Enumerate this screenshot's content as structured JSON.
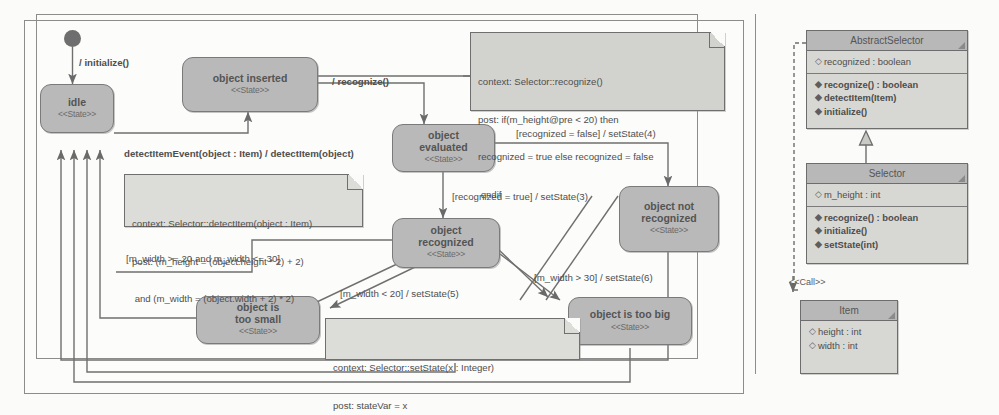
{
  "diagram": {
    "kind": "uml-state-machine-and-class-diagram",
    "title": "",
    "colors": {
      "state_fill": "#b9b9b9",
      "state_border": "#7a7a7a",
      "note_fill": "#d2d2ce",
      "class_fill": "#d7d7d3",
      "class_header_fill": "#b8b8b8",
      "line": "#6f6f6f",
      "page_bg": "#fbfbf9"
    }
  },
  "statechart": {
    "initial_pseudostate": "initial-state",
    "states": [
      {
        "id": "idle",
        "name": "idle",
        "stereotype": "<<State>>"
      },
      {
        "id": "object_inserted",
        "name": "object inserted",
        "stereotype": "<<State>>"
      },
      {
        "id": "object_evaluated",
        "name": "object\nevaluated",
        "name_l1": "object",
        "name_l2": "evaluated",
        "stereotype": "<<State>>"
      },
      {
        "id": "object_recognized",
        "name": "object\nrecognized",
        "name_l1": "object",
        "name_l2": "recognized",
        "stereotype": "<<State>>"
      },
      {
        "id": "object_not_recognized",
        "name_l1": "object not",
        "name_l2": "recognized",
        "stereotype": "<<State>>"
      },
      {
        "id": "object_is_too_small",
        "name_l1": "object is",
        "name_l2": "too small",
        "stereotype": "<<State>>"
      },
      {
        "id": "object_is_too_big",
        "name_l1": "object is too big",
        "name_l2": "",
        "stereotype": "<<State>>"
      }
    ],
    "transition_labels": [
      {
        "id": "t_initialize",
        "text": "/ initialize()"
      },
      {
        "id": "t_detect",
        "text": "detectItemEvent(object : Item) / detectItem(object)"
      },
      {
        "id": "t_recognize",
        "text": "/ recognize()"
      },
      {
        "id": "t_rec_false",
        "text": "[recognized = false] / setState(4)"
      },
      {
        "id": "t_rec_true",
        "text": "[recognized = true] / setState(3)"
      },
      {
        "id": "t_width_range",
        "text": "[m_width >= 20 and m_width <= 30]"
      },
      {
        "id": "t_width_lt20",
        "text": "[m_width < 20] / setState(5)"
      },
      {
        "id": "t_width_gt30",
        "text": "[m_width > 30] / setState(6)"
      }
    ],
    "notes": [
      {
        "id": "note_recognize",
        "lines": [
          "context: Selector::recognize()",
          "post: if(m_height@pre < 20) then",
          "recognized = true else recognized = false",
          " endif"
        ]
      },
      {
        "id": "note_detectitem",
        "lines": [
          "context: Selector::detectItem(object : Item)",
          "post: (m_height = (object.height * 2) + 2)",
          " and (m_width = (object.width + 2) * 2)"
        ]
      },
      {
        "id": "note_setstate",
        "lines": [
          "context: Selector::setState(x : Integer)",
          "post: stateVar = x"
        ]
      }
    ]
  },
  "class_diagram": {
    "classes": [
      {
        "id": "abstract_selector",
        "name": "AbstractSelector",
        "attributes": [
          {
            "glyph": "attr-icon",
            "text": "recognized : boolean"
          }
        ],
        "operations": [
          {
            "glyph": "op-icon",
            "text": "recognize() : boolean"
          },
          {
            "glyph": "op-icon",
            "text": "detectItem(Item)"
          },
          {
            "glyph": "op-icon",
            "text": "initialize()"
          }
        ]
      },
      {
        "id": "selector",
        "name": "Selector",
        "attributes": [
          {
            "glyph": "attr-icon",
            "text": "m_height : int"
          }
        ],
        "operations": [
          {
            "glyph": "op-icon",
            "text": "recognize() : boolean"
          },
          {
            "glyph": "op-icon",
            "text": "initialize()"
          },
          {
            "glyph": "op-icon",
            "text": "setState(int)"
          }
        ]
      },
      {
        "id": "item",
        "name": "Item",
        "attributes": [
          {
            "glyph": "attr-icon",
            "text": "height : int"
          },
          {
            "glyph": "attr-icon",
            "text": "width : int"
          }
        ],
        "operations": []
      }
    ],
    "relations": [
      {
        "id": "generalization",
        "from": "selector",
        "to": "abstract_selector",
        "kind": "generalization"
      },
      {
        "id": "call_dependency",
        "from": "selector",
        "to": "item",
        "kind": "dependency",
        "stereotype": "<<Call>>"
      }
    ]
  }
}
